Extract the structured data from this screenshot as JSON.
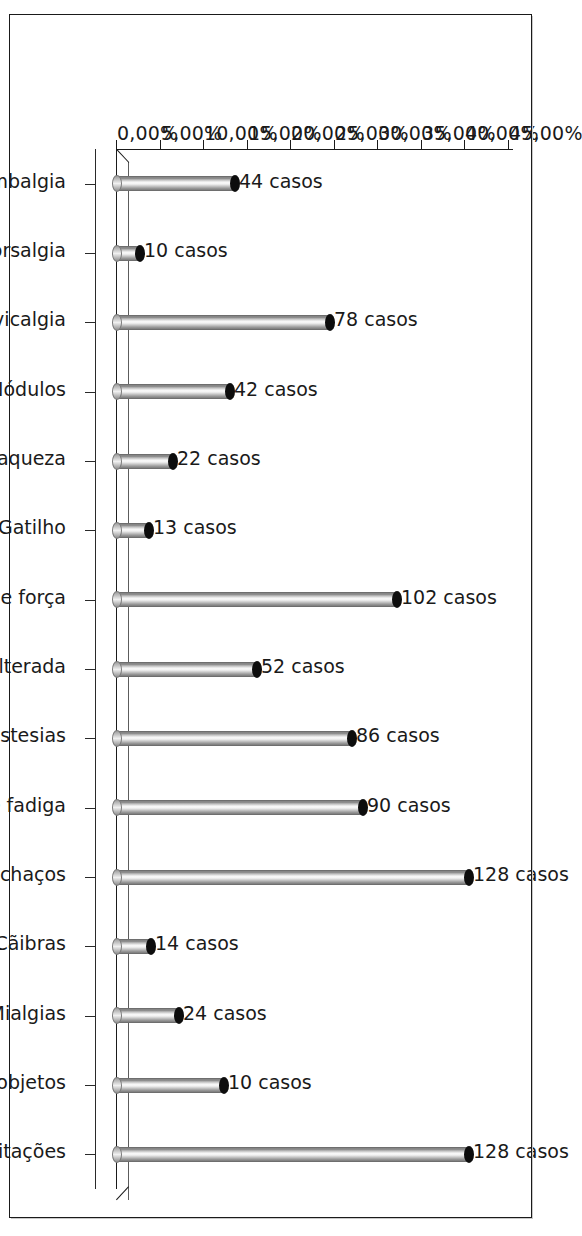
{
  "chart_data": {
    "type": "bar",
    "title": "",
    "subtitle": "",
    "xlabel": "",
    "ylabel": "",
    "orientation": "vertical-bars-rotated-90",
    "grid": false,
    "legend": null,
    "ylim": [
      0,
      45
    ],
    "ytick_labels": [
      "0,00%",
      "5,00%",
      "10,00%",
      "15,00%",
      "20,00%",
      "25,00%",
      "30,00%",
      "35,00%",
      "40,00%",
      "45,00%"
    ],
    "ytick_values": [
      0,
      5,
      10,
      15,
      20,
      25,
      30,
      35,
      40,
      45
    ],
    "value_unit": "casos",
    "categories": [
      "Lombalgia",
      "Dorsalgia",
      "Cervicalgia",
      "Nódulos",
      "Fraqueza",
      "Gatilho",
      "Perda de força",
      "Caligrafia alterada",
      "Queimações, formigamentos, dormências ou parestesias",
      "Peso, cansaço e fadiga",
      "Inchaços",
      "Cãibras",
      "Mialgias",
      "Queda de objetos",
      "Limitações"
    ],
    "data_labels": [
      "44 casos",
      "10 casos",
      "78 casos",
      "42 casos",
      "22 casos",
      "13 casos",
      "102 casos",
      "52 casos",
      "86 casos",
      "90 casos",
      "128 casos",
      "14 casos",
      "24 casos",
      "10 casos",
      "128 casos"
    ],
    "counts": [
      44,
      10,
      78,
      42,
      22,
      13,
      102,
      52,
      86,
      90,
      128,
      14,
      24,
      10,
      128
    ],
    "values": [
      14.1,
      3.2,
      25.0,
      13.5,
      7.0,
      4.2,
      32.7,
      16.7,
      27.6,
      28.8,
      41.0,
      4.5,
      7.7,
      12.8,
      41.0
    ]
  }
}
